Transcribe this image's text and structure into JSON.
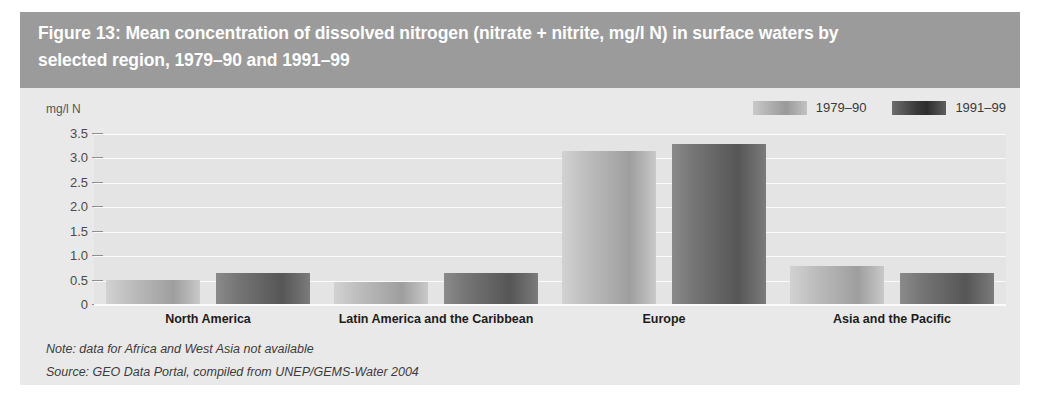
{
  "figure": {
    "title": "Figure 13: Mean concentration of dissolved nitrogen (nitrate + nitrite, mg/l N) in surface waters by\nselected region, 1979–90 and 1991–99",
    "note": "Note: data for Africa and West Asia not available",
    "source": "Source: GEO Data Portal, compiled from UNEP/GEMS-Water 2004",
    "colors": {
      "title_band": "#9b9b9b",
      "panel": "#e9e9e9",
      "plot": "#e4e4e4",
      "gridline": "#fbfbfb",
      "series_1979_90": "#a8a8a8",
      "series_1991_99": "#5e5e5e"
    }
  },
  "chart_data": {
    "type": "bar",
    "title": "Figure 13: Mean concentration of dissolved nitrogen (nitrate + nitrite, mg/l N) in surface waters by selected region, 1979–90 and 1991–99",
    "xlabel": "",
    "ylabel": "mg/l N",
    "ylim": [
      0,
      3.5
    ],
    "yticks": [
      "0",
      "0.5",
      "1.0",
      "1.5",
      "2.0",
      "2.5",
      "3.0",
      "3.5"
    ],
    "ytick_values": [
      0,
      0.5,
      1.0,
      1.5,
      2.0,
      2.5,
      3.0,
      3.5
    ],
    "grid": true,
    "legend_position": "top-right",
    "categories": [
      "North America",
      "Latin America and the Caribbean",
      "Europe",
      "Asia and the Pacific"
    ],
    "series": [
      {
        "name": "1979–90",
        "values": [
          0.52,
          0.47,
          3.15,
          0.8
        ]
      },
      {
        "name": "1991–99",
        "values": [
          0.65,
          0.65,
          3.3,
          0.65
        ]
      }
    ],
    "note": "Note: data for Africa and West Asia not available",
    "source": "Source: GEO Data Portal, compiled from UNEP/GEMS-Water 2004"
  }
}
